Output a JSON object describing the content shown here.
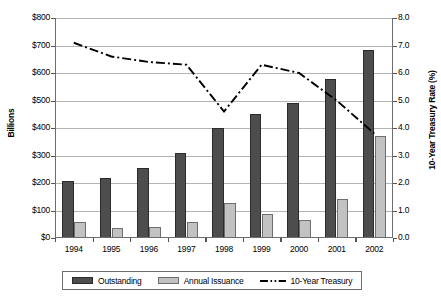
{
  "chart_data": {
    "type": "bar",
    "title": "",
    "subtitle": "",
    "xlabel": "",
    "ylabel": "Billions",
    "y2label": "10-Year Treasury Rate (%)",
    "categories": [
      "1994",
      "1995",
      "1996",
      "1997",
      "1998",
      "1999",
      "2000",
      "2001",
      "2002"
    ],
    "ylim": [
      0,
      800
    ],
    "y2lim": [
      0,
      8
    ],
    "yticks": [
      "$0",
      "$100",
      "$200",
      "$300",
      "$400",
      "$500",
      "$600",
      "$700",
      "$800"
    ],
    "ytick_values": [
      0,
      100,
      200,
      300,
      400,
      500,
      600,
      700,
      800
    ],
    "y2ticks": [
      "0.0",
      "1.0",
      "2.0",
      "3.0",
      "4.0",
      "5.0",
      "6.0",
      "7.0",
      "8.0"
    ],
    "y2tick_values": [
      0,
      1,
      2,
      3,
      4,
      5,
      6,
      7,
      8
    ],
    "grid": true,
    "legend_position": "bottom",
    "series": [
      {
        "name": "Outstanding",
        "type": "bar",
        "axis": "left",
        "color": "#4d4d4d",
        "values": [
          207,
          220,
          253,
          310,
          400,
          450,
          492,
          580,
          685
        ]
      },
      {
        "name": "Annual Issuance",
        "type": "bar",
        "axis": "left",
        "color": "#c2c2c2",
        "values": [
          60,
          38,
          39,
          57,
          128,
          88,
          66,
          143,
          370
        ]
      },
      {
        "name": "10-Year Treasury",
        "type": "line",
        "axis": "right",
        "color": "#000000",
        "dash": "dash-dot",
        "values": [
          7.1,
          6.6,
          6.4,
          6.3,
          4.6,
          6.3,
          6.0,
          5.0,
          3.8
        ]
      }
    ]
  },
  "legend": {
    "items": [
      {
        "label": "Outstanding",
        "icon": "bar-swatch-dark"
      },
      {
        "label": "Annual Issuance",
        "icon": "bar-swatch-light"
      },
      {
        "label": "10-Year Treasury",
        "icon": "dash-dot-line-swatch"
      }
    ]
  }
}
